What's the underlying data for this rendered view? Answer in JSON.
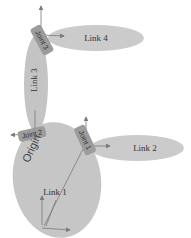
{
  "diagram": {
    "title": "",
    "colors": {
      "link_fill": "#c8c8c8",
      "link_fill_dark": "#bdbdbd",
      "joint_fill": "#9a9a9a",
      "arrow": "#7a7a7a",
      "text": "#333333"
    },
    "links": [
      {
        "id": "link1",
        "label": "Link 1"
      },
      {
        "id": "link2",
        "label": "Link 2"
      },
      {
        "id": "link3",
        "label": "Link 3"
      },
      {
        "id": "link4",
        "label": "Link 4"
      }
    ],
    "joints": [
      {
        "id": "joint1",
        "label": "Joint 1"
      },
      {
        "id": "joint2",
        "label": "Joint 2"
      },
      {
        "id": "joint3",
        "label": "Joint 3"
      }
    ],
    "origin": {
      "label": "Origin"
    }
  }
}
